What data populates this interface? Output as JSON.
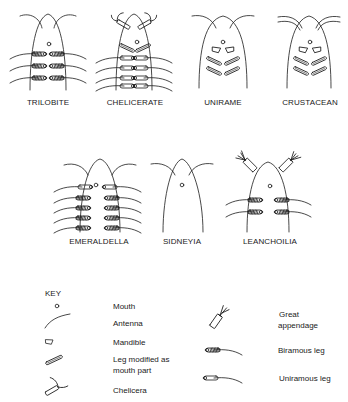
{
  "figures": {
    "row1": [
      {
        "id": "trilobite",
        "label": "TRILOBITE",
        "features": [
          "antenna",
          "mouth",
          "biramous-leg"
        ]
      },
      {
        "id": "chelicerate",
        "label": "CHELICERATE",
        "features": [
          "chelicera",
          "mouth",
          "leg-modified-as-mouth-part",
          "uniramous-leg"
        ]
      },
      {
        "id": "unirame",
        "label": "UNIRAME",
        "features": [
          "antenna",
          "mouth",
          "mandible",
          "leg-modified-as-mouth-part"
        ]
      },
      {
        "id": "crustacean",
        "label": "CRUSTACEAN",
        "features": [
          "antenna",
          "antenna",
          "mouth",
          "mandible",
          "leg-modified-as-mouth-part"
        ]
      }
    ],
    "row2": [
      {
        "id": "emeraldella",
        "label": "EMERALDELLA",
        "features": [
          "antenna",
          "mouth",
          "uniramous-leg",
          "biramous-leg"
        ]
      },
      {
        "id": "sidneyia",
        "label": "SIDNEYIA",
        "features": [
          "antenna",
          "mouth"
        ]
      },
      {
        "id": "leanchoilia",
        "label": "LEANCHOILIA",
        "features": [
          "great-appendage",
          "mouth",
          "biramous-leg"
        ]
      }
    ]
  },
  "key": {
    "title": "KEY",
    "left": [
      {
        "icon": "mouth-icon",
        "label": "Mouth"
      },
      {
        "icon": "antenna-icon",
        "label": "Antenna"
      },
      {
        "icon": "mandible-icon",
        "label": "Mandible"
      },
      {
        "icon": "modified-leg-icon",
        "label_line1": "Leg modified as",
        "label_line2": "mouth part"
      },
      {
        "icon": "chelicera-icon",
        "label": "Chelicera"
      }
    ],
    "right": [
      {
        "icon": "great-appendage-icon",
        "label_line1": "Great",
        "label_line2": "appendage"
      },
      {
        "icon": "biramous-leg-icon",
        "label": "Biramous leg"
      },
      {
        "icon": "uniramous-leg-icon",
        "label": "Uniramous leg"
      }
    ]
  },
  "colors": {
    "ink": "#1a1a1a",
    "background": "#ffffff"
  }
}
